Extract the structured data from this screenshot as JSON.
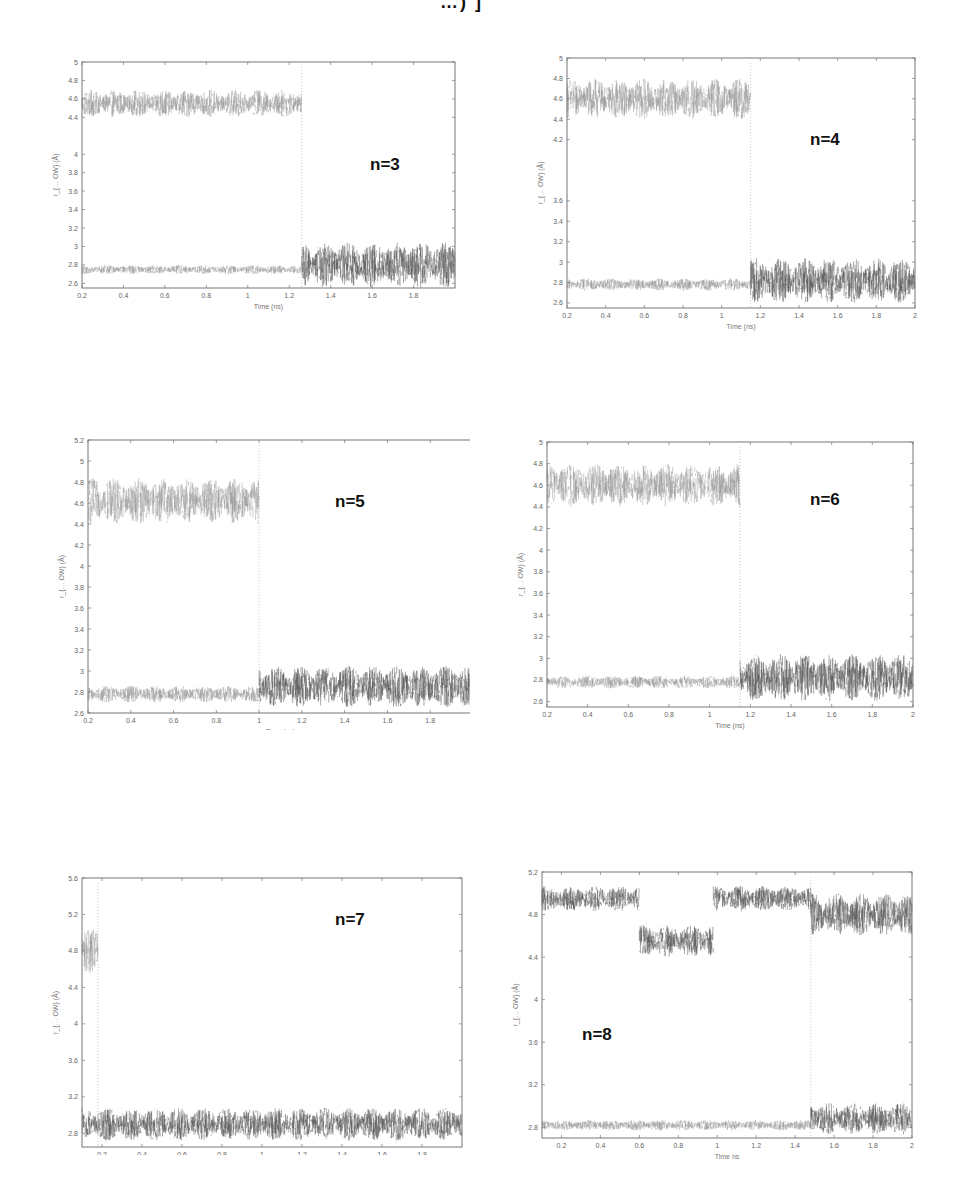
{
  "page": {
    "header_fragment": "…) ]"
  },
  "chart_data": [
    {
      "type": "line",
      "id": "n3",
      "annotation": "n=3",
      "xlabel": "Time (ns)",
      "ylabel": "r_{… OW} (Å)",
      "xlim": [
        0.2,
        2
      ],
      "ylim": [
        2.55,
        5
      ],
      "xticks": [
        "0.2",
        "0.4",
        "0.6",
        "0.8",
        "1",
        "1.2",
        "1.4",
        "1.6",
        "1.8"
      ],
      "yticks": [
        "2.6",
        "2.8",
        "3",
        "3.2",
        "3.4",
        "3.6",
        "3.8",
        "4",
        "4.4",
        "4.6",
        "4.8",
        "5"
      ],
      "grid": false,
      "series": [
        {
          "name": "upper",
          "segments": [
            {
              "x0": 0.2,
              "x1": 1.26,
              "mean": 4.55,
              "amp": 0.15
            }
          ]
        },
        {
          "name": "lower",
          "segments": [
            {
              "x0": 0.2,
              "x1": 1.26,
              "mean": 2.75,
              "amp": 0.05
            },
            {
              "x0": 1.26,
              "x1": 2.0,
              "mean": 2.8,
              "amp": 0.25
            }
          ]
        }
      ],
      "transition_x": 1.26
    },
    {
      "type": "line",
      "id": "n4",
      "annotation": "n=4",
      "xlabel": "Time (ns)",
      "ylabel": "r_{… OW} (Å)",
      "xlim": [
        0.2,
        2
      ],
      "ylim": [
        2.55,
        5
      ],
      "xticks": [
        "0.2",
        "0.4",
        "0.6",
        "0.8",
        "1",
        "1.2",
        "1.4",
        "1.6",
        "1.8",
        "2"
      ],
      "yticks": [
        "2.6",
        "2.8",
        "3",
        "3.2",
        "3.4",
        "3.6",
        "4.2",
        "4.4",
        "4.6",
        "4.8",
        "5"
      ],
      "grid": false,
      "series": [
        {
          "name": "upper",
          "segments": [
            {
              "x0": 0.2,
              "x1": 1.15,
              "mean": 4.6,
              "amp": 0.2
            }
          ]
        },
        {
          "name": "lower",
          "segments": [
            {
              "x0": 0.2,
              "x1": 1.15,
              "mean": 2.78,
              "amp": 0.06
            },
            {
              "x0": 1.15,
              "x1": 2.0,
              "mean": 2.82,
              "amp": 0.22
            }
          ]
        }
      ],
      "transition_x": 1.15
    },
    {
      "type": "line",
      "id": "n5",
      "annotation": "n=5",
      "xlabel": "Time (ns)",
      "ylabel": "r_{… OW} (Å)",
      "xlim": [
        0.2,
        2
      ],
      "ylim": [
        2.6,
        5.2
      ],
      "xticks": [
        "0.2",
        "0.4",
        "0.6",
        "0.8",
        "1",
        "1.2",
        "1.4",
        "1.6",
        "1.8",
        "1"
      ],
      "yticks": [
        "2.6",
        "2.8",
        "3",
        "3.2",
        "3.4",
        "3.6",
        "3.8",
        "4",
        "4.2",
        "4.4",
        "4.6",
        "4.8",
        "5",
        "5.2"
      ],
      "grid": false,
      "series": [
        {
          "name": "upper",
          "segments": [
            {
              "x0": 0.2,
              "x1": 1.0,
              "mean": 4.62,
              "amp": 0.22
            }
          ]
        },
        {
          "name": "lower",
          "segments": [
            {
              "x0": 0.2,
              "x1": 1.0,
              "mean": 2.78,
              "amp": 0.08
            },
            {
              "x0": 1.0,
              "x1": 2.0,
              "mean": 2.85,
              "amp": 0.2
            }
          ]
        }
      ],
      "transition_x": 1.0
    },
    {
      "type": "line",
      "id": "n6",
      "annotation": "n=6",
      "xlabel": "Time (ns)",
      "ylabel": "r_{… OW} (Å)",
      "xlim": [
        0.2,
        2
      ],
      "ylim": [
        2.55,
        5
      ],
      "xticks": [
        "0.2",
        "0.4",
        "0.6",
        "0.8",
        "1",
        "1.2",
        "1.4",
        "1.6",
        "1.8",
        "2"
      ],
      "yticks": [
        "2.6",
        "2.8",
        "3",
        "3.2",
        "3.4",
        "3.6",
        "3.8",
        "4",
        "4.2",
        "4.4",
        "4.6",
        "4.8",
        "5"
      ],
      "grid": false,
      "series": [
        {
          "name": "upper",
          "segments": [
            {
              "x0": 0.2,
              "x1": 1.15,
              "mean": 4.6,
              "amp": 0.2
            }
          ]
        },
        {
          "name": "lower",
          "segments": [
            {
              "x0": 0.2,
              "x1": 1.15,
              "mean": 2.78,
              "amp": 0.06
            },
            {
              "x0": 1.15,
              "x1": 2.0,
              "mean": 2.82,
              "amp": 0.22
            }
          ]
        }
      ],
      "transition_x": 1.15
    },
    {
      "type": "line",
      "id": "n7",
      "annotation": "n=7",
      "xlabel": "Time ns",
      "ylabel": "r_{… OW} (Å)",
      "xlim": [
        0.1,
        2
      ],
      "ylim": [
        2.65,
        5.6
      ],
      "xticks": [
        "0.2",
        "0.4",
        "0.6",
        "0.8",
        "1",
        "1.2",
        "1.4",
        "1.6",
        "1.8"
      ],
      "yticks": [
        "2.8",
        "3.2",
        "3.6",
        "4",
        "4.4",
        "4.8",
        "5.2",
        "5.6"
      ],
      "grid": false,
      "series": [
        {
          "name": "upper",
          "segments": [
            {
              "x0": 0.1,
              "x1": 0.18,
              "mean": 4.8,
              "amp": 0.25
            }
          ]
        },
        {
          "name": "lower",
          "segments": [
            {
              "x0": 0.1,
              "x1": 2.0,
              "mean": 2.9,
              "amp": 0.18
            }
          ]
        }
      ],
      "transition_x": 0.18
    },
    {
      "type": "line",
      "id": "n8",
      "annotation": "n=8",
      "xlabel": "Time ns",
      "ylabel": "r_{… OW} (Å)",
      "xlim": [
        0.1,
        2
      ],
      "ylim": [
        2.7,
        5.2
      ],
      "xticks": [
        "0.2",
        "0.4",
        "0.6",
        "0.8",
        "1",
        "1.2",
        "1.4",
        "1.6",
        "1.8",
        "2"
      ],
      "yticks": [
        "2.8",
        "3.2",
        "3.6",
        "4",
        "4.4",
        "4.8",
        "5.2"
      ],
      "grid": false,
      "series": [
        {
          "name": "upper",
          "segments": [
            {
              "x0": 0.1,
              "x1": 0.6,
              "mean": 4.95,
              "amp": 0.12
            },
            {
              "x0": 0.6,
              "x1": 0.98,
              "mean": 4.55,
              "amp": 0.15
            },
            {
              "x0": 0.98,
              "x1": 1.48,
              "mean": 4.95,
              "amp": 0.12
            },
            {
              "x0": 1.48,
              "x1": 2.0,
              "mean": 4.8,
              "amp": 0.2
            }
          ]
        },
        {
          "name": "lower",
          "segments": [
            {
              "x0": 0.1,
              "x1": 1.48,
              "mean": 2.82,
              "amp": 0.05
            },
            {
              "x0": 1.48,
              "x1": 2.0,
              "mean": 2.88,
              "amp": 0.15
            }
          ]
        }
      ],
      "transition_x": 1.48
    }
  ]
}
